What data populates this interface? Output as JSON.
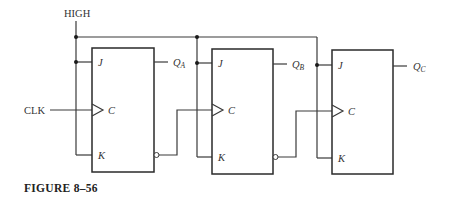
{
  "figure": {
    "caption": "FIGURE 8–56",
    "high_label": "HIGH",
    "clk_label": "CLK"
  },
  "flip_flops": [
    {
      "name": "A",
      "j_label": "J",
      "c_label": "C",
      "k_label": "K",
      "q_label": "Q",
      "q_sub": "A"
    },
    {
      "name": "B",
      "j_label": "J",
      "c_label": "C",
      "k_label": "K",
      "q_label": "Q",
      "q_sub": "B"
    },
    {
      "name": "C",
      "j_label": "J",
      "c_label": "C",
      "k_label": "K",
      "q_label": "Q",
      "q_sub": "C"
    }
  ],
  "colors": {
    "line": "#3a3a3a",
    "text": "#333333",
    "background": "#ffffff"
  }
}
